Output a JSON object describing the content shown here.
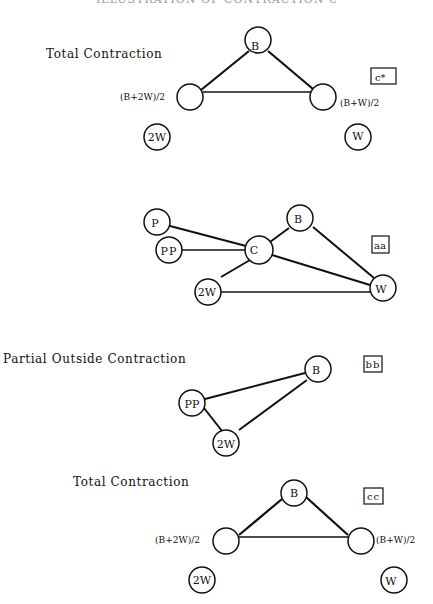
{
  "title": "ILLUSTRATION OF CONTRACTION OPERATION",
  "sections": [
    {
      "label": "Total Contraction",
      "tag": "c*",
      "nodes": {
        "B": "B",
        "left": "",
        "right": "",
        "twoW": "2W",
        "W": "W"
      },
      "side_labels": {
        "left": "(B+2W)/2",
        "right": "(B+W)/2"
      }
    },
    {
      "label": "",
      "tag": "aa",
      "nodes": {
        "P": "P",
        "PP": "PP",
        "C": "C",
        "B": "B",
        "twoW": "2W",
        "W": "W"
      }
    },
    {
      "label": "Partial Outside Contraction",
      "tag": "bb",
      "nodes": {
        "B": "B",
        "PP": "PP",
        "twoW": "2W"
      }
    },
    {
      "label": "Total Contraction",
      "tag": "cc",
      "nodes": {
        "B": "B",
        "left": "",
        "right": "",
        "twoW": "2W",
        "W": "W"
      },
      "side_labels": {
        "left": "(B+2W)/2",
        "right": "(B+W)/2"
      }
    }
  ],
  "colors": {
    "stroke": "#111111",
    "background": "#ffffff"
  }
}
